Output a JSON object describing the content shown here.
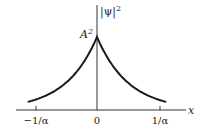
{
  "chart_data": {
    "type": "line",
    "title": "",
    "function": "|psi|^2 = A^2 exp(-2 alpha |x|)",
    "xlabel": "x",
    "ylabel": "|ψ|²",
    "x_ticks": [
      "−1/α",
      "0",
      "1/α"
    ],
    "x_tick_values": [
      -1,
      0,
      1
    ],
    "y_annotation": "A²",
    "peak_value_label": "A²",
    "series": [
      {
        "name": "|ψ|²",
        "x": [
          -1.1,
          -1.0,
          -0.75,
          -0.5,
          -0.25,
          0,
          0.25,
          0.5,
          0.75,
          1.0,
          1.1
        ],
        "values": [
          0.111,
          0.135,
          0.223,
          0.368,
          0.607,
          1.0,
          0.607,
          0.368,
          0.223,
          0.135,
          0.111
        ]
      }
    ],
    "xlim": [
      -1.3,
      1.45
    ],
    "ylim": [
      0,
      1.25
    ],
    "grid": false,
    "legend": "none",
    "colors": {
      "curve": "#1a1a1a",
      "axes": "#333333"
    }
  },
  "labels": {
    "x_axis": "x",
    "y_axis_psi": "|ψ|",
    "y_axis_exp": "2",
    "peak_base": "A",
    "peak_exp": "2",
    "tick_neg": "−1/α",
    "tick_zero": "0",
    "tick_pos": "1/α"
  }
}
